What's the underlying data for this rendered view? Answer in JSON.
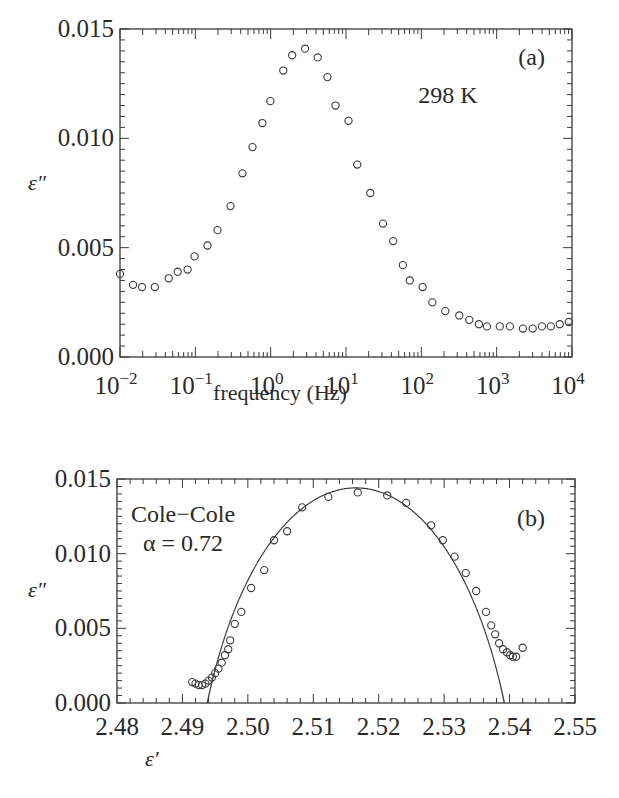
{
  "chart_data": [
    {
      "id": "a",
      "type": "scatter",
      "panel_label": "(a)",
      "annotation": "298 K",
      "xlabel": "frequency (Hz)",
      "ylabel": "ε″",
      "xscale": "log",
      "xlim": [
        0.01,
        10000
      ],
      "ylim": [
        0.0,
        0.015
      ],
      "x_tick_labels": [
        "10",
        "10",
        "10",
        "10",
        "10",
        "10",
        "10"
      ],
      "x_tick_exponents": [
        "−2",
        "−1",
        "0",
        "1",
        "2",
        "3",
        "4"
      ],
      "x_ticks": [
        0.01,
        0.1,
        1,
        10,
        100,
        1000,
        10000
      ],
      "y_tick_labels": [
        "0.000",
        "0.005",
        "0.010",
        "0.015"
      ],
      "y_ticks": [
        0.0,
        0.005,
        0.01,
        0.015
      ],
      "grid": false,
      "marker": "open-circle",
      "series": [
        {
          "name": "ε″ vs frequency",
          "x": [
            0.01,
            0.0149,
            0.0196,
            0.029,
            0.0444,
            0.0583,
            0.0789,
            0.0976,
            0.145,
            0.197,
            0.293,
            0.422,
            0.574,
            0.776,
            0.99,
            1.47,
            1.93,
            2.86,
            4.21,
            5.67,
            7.26,
            10.8,
            14.1,
            21.0,
            31.0,
            42.3,
            56.9,
            70.2,
            104,
            140,
            208,
            319,
            433,
            581,
            743,
            1100,
            1500,
            2230,
            3010,
            3990,
            5230,
            6880,
            9050
          ],
          "y": [
            0.0038,
            0.0033,
            0.0032,
            0.0032,
            0.0036,
            0.0039,
            0.004,
            0.0046,
            0.0051,
            0.0058,
            0.0069,
            0.0084,
            0.0096,
            0.0107,
            0.0117,
            0.0131,
            0.0138,
            0.0141,
            0.0137,
            0.0128,
            0.0115,
            0.0108,
            0.0088,
            0.0075,
            0.0061,
            0.0053,
            0.0042,
            0.0035,
            0.0032,
            0.0025,
            0.0021,
            0.0019,
            0.0017,
            0.0015,
            0.0014,
            0.0014,
            0.0014,
            0.0013,
            0.0013,
            0.0014,
            0.0014,
            0.0015,
            0.0016
          ]
        }
      ]
    },
    {
      "id": "b",
      "type": "scatter",
      "panel_label": "(b)",
      "annotation_lines": [
        "Cole−Cole",
        "α = 0.72"
      ],
      "xlabel": "ε′",
      "ylabel": "ε″",
      "xlim": [
        2.48,
        2.55
      ],
      "ylim": [
        0.0,
        0.015
      ],
      "x_tick_labels": [
        "2.48",
        "2.49",
        "2.50",
        "2.51",
        "2.52",
        "2.53",
        "2.54",
        "2.55"
      ],
      "x_ticks": [
        2.48,
        2.49,
        2.5,
        2.51,
        2.52,
        2.53,
        2.54,
        2.55
      ],
      "y_tick_labels": [
        "0.000",
        "0.005",
        "0.010",
        "0.015"
      ],
      "y_ticks": [
        0.0,
        0.005,
        0.01,
        0.015
      ],
      "grid": false,
      "series": [
        {
          "name": "data",
          "marker": "open-circle",
          "x": [
            2.4915,
            2.492,
            2.4925,
            2.493,
            2.4935,
            2.494,
            2.4945,
            2.495,
            2.4955,
            2.496,
            2.4965,
            2.497,
            2.4973,
            2.498,
            2.499,
            2.5005,
            2.5025,
            2.504,
            2.506,
            2.5083,
            2.5123,
            2.5168,
            2.5213,
            2.5242,
            2.528,
            2.5298,
            2.5316,
            2.5333,
            2.5349,
            2.5364,
            2.5372,
            2.5378,
            2.5384,
            2.539,
            2.5396,
            2.5401,
            2.5405,
            2.541,
            2.542
          ],
          "y": [
            0.0014,
            0.0013,
            0.0012,
            0.0012,
            0.0013,
            0.0015,
            0.0017,
            0.002,
            0.0023,
            0.0027,
            0.0032,
            0.0036,
            0.0042,
            0.0053,
            0.0061,
            0.0077,
            0.0089,
            0.0109,
            0.0115,
            0.0131,
            0.0138,
            0.0141,
            0.0139,
            0.0134,
            0.0119,
            0.0109,
            0.0098,
            0.0087,
            0.0075,
            0.0061,
            0.0052,
            0.0046,
            0.004,
            0.0036,
            0.0034,
            0.0032,
            0.0031,
            0.0031,
            0.0037
          ]
        },
        {
          "name": "Cole-Cole fit",
          "marker": "line",
          "alpha": 0.72,
          "eps_inf": 2.4938,
          "eps_s": 2.5392
        }
      ]
    }
  ]
}
